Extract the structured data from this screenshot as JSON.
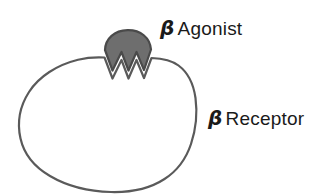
{
  "figure": {
    "background_color": "#ffffff",
    "width": 334,
    "height": 196
  },
  "labels": {
    "agonist": {
      "symbol": "β",
      "text": "Agonist",
      "color": "#1a1a1a"
    },
    "receptor": {
      "symbol": "β",
      "text": "Receptor",
      "color": "#1a1a1a"
    }
  },
  "shapes": {
    "receptor": {
      "name": "beta-receptor-body",
      "fill": "#ffffff",
      "stroke": "#5a5a5a",
      "stroke_width": 2.2,
      "description": "large rounded irregular blob outline with a zigzag W-shaped binding cleft at the top"
    },
    "agonist": {
      "name": "beta-agonist-ligand",
      "fill": "#6e6e6e",
      "stroke": "#4a4a4a",
      "stroke_width": 2.2,
      "description": "gray fan/wedge shape with zigzag W bottom that interlocks into the receptor cleft"
    }
  }
}
